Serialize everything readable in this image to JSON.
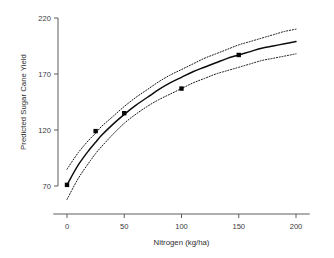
{
  "chart_data": {
    "type": "line",
    "title": "",
    "xlabel": "Nitrogen (kg/ha)",
    "ylabel": "Predicted Sugar Cane Yield",
    "xlim": [
      -12,
      212
    ],
    "ylim": [
      52,
      225
    ],
    "xticks": [
      0,
      50,
      100,
      150,
      200
    ],
    "yticks": [
      70,
      120,
      170,
      220
    ],
    "xtick_labels": [
      "0",
      "50",
      "100",
      "150",
      "200"
    ],
    "ytick_labels": [
      "70",
      "120",
      "170",
      "220"
    ],
    "grid": false,
    "legend": null,
    "series": [
      {
        "name": "Fitted response curve",
        "style": "solid",
        "color": "#0b0b0b",
        "x": [
          0,
          10,
          20,
          25,
          30,
          40,
          50,
          60,
          70,
          80,
          90,
          100,
          110,
          120,
          130,
          140,
          150,
          160,
          170,
          180,
          190,
          200
        ],
        "values": [
          71,
          89,
          103,
          109,
          115,
          125,
          134,
          142,
          149,
          156,
          162,
          167,
          172,
          176,
          180,
          184,
          187,
          190,
          193,
          195,
          197,
          199
        ]
      },
      {
        "name": "Upper 95% confidence band",
        "style": "dotted",
        "color": "#141414",
        "x": [
          0,
          10,
          20,
          25,
          30,
          40,
          50,
          60,
          70,
          80,
          90,
          100,
          110,
          120,
          130,
          140,
          150,
          160,
          170,
          180,
          190,
          200
        ],
        "values": [
          85,
          100,
          112,
          117,
          123,
          132,
          141,
          149,
          156,
          163,
          169,
          174,
          179,
          184,
          188,
          192,
          196,
          199,
          202,
          205,
          208,
          210
        ]
      },
      {
        "name": "Lower 95% confidence band",
        "style": "dotted",
        "color": "#141414",
        "x": [
          0,
          10,
          20,
          25,
          30,
          40,
          50,
          60,
          70,
          80,
          90,
          100,
          110,
          120,
          130,
          140,
          150,
          160,
          170,
          180,
          190,
          200
        ],
        "values": [
          58,
          77,
          92,
          99,
          105,
          116,
          126,
          134,
          141,
          147,
          152,
          157,
          162,
          166,
          170,
          173,
          176,
          179,
          182,
          184,
          186,
          188
        ]
      }
    ],
    "points": {
      "name": "Observed means",
      "marker": "filled-square",
      "color": "#060606",
      "x": [
        0,
        25,
        50,
        100,
        150
      ],
      "values": [
        71,
        119,
        135,
        157,
        187
      ]
    }
  }
}
